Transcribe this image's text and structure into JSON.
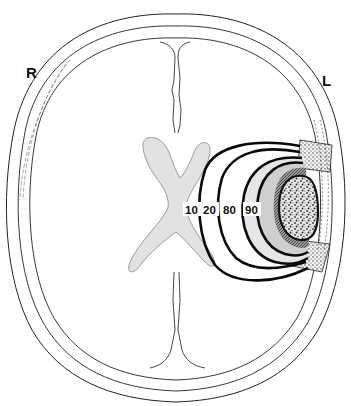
{
  "figure": {
    "orientation_labels": {
      "right": "R",
      "left": "L"
    },
    "isodose_lines": [
      {
        "value": 10,
        "label": "10"
      },
      {
        "value": 20,
        "label": "20"
      },
      {
        "value": 80,
        "label": "80"
      },
      {
        "value": 90,
        "label": "90"
      }
    ],
    "structures": [
      "outer-skull-table",
      "inner-skull-table",
      "dura",
      "falx-anterior",
      "falx-posterior",
      "lateral-ventricles",
      "tumor",
      "cranial-window"
    ],
    "colors": {
      "outline": "#222222",
      "isodose_line": "#0a0a0a",
      "ventricles": "#e2e2e2",
      "dose_20_80": "#e6e6e6",
      "dose_80_90": "#c8c8c8",
      "dose_90_plus": "#7a7a7a",
      "tumor": "#bfbfbf",
      "background": "#ffffff"
    }
  }
}
